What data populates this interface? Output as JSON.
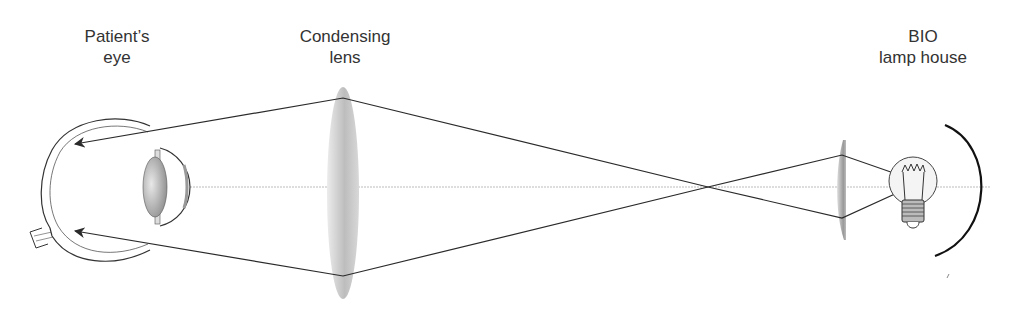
{
  "labels": {
    "patient_eye": {
      "line1": "Patient’s",
      "line2": "eye"
    },
    "condensing_lens": {
      "line1": "Condensing",
      "line2": "lens"
    },
    "lamp_house": {
      "line1": "BIO",
      "line2": "lamp house"
    }
  },
  "colors": {
    "ray": "#2a2a2a",
    "axis": "#bbbbbb",
    "lens_fill": "#c9c9c9",
    "text": "#333333"
  },
  "icons": [
    "eye-diagram",
    "condensing-lens",
    "small-lens",
    "light-bulb-icon",
    "reflector-mirror"
  ]
}
